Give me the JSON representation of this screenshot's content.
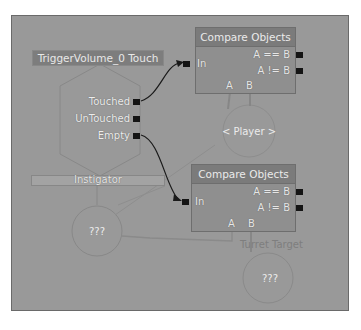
{
  "graph": {
    "event_node": {
      "title": "TriggerVolume_0 Touch",
      "outputs": [
        "Touched",
        "UnTouched",
        "Empty"
      ],
      "variable_link": "Instigator"
    },
    "compare_nodes": [
      {
        "title": "Compare Objects",
        "input": "In",
        "outputs": [
          "A == B",
          "A != B"
        ],
        "variable_links": [
          "A",
          "B"
        ]
      },
      {
        "title": "Compare Objects",
        "input": "In",
        "outputs": [
          "A == B",
          "A != B"
        ],
        "variable_links": [
          "A",
          "B"
        ]
      }
    ],
    "variables": [
      {
        "label": "< Player >"
      },
      {
        "label": "???"
      },
      {
        "label": "???",
        "caption": "Turret Target"
      }
    ]
  },
  "colors": {
    "canvas": "#999999",
    "node_body": "#8f8f8f",
    "node_title": "#7b7b7b",
    "port": "#141414",
    "wire": "#1a1a1a",
    "var_link": "#858585"
  }
}
